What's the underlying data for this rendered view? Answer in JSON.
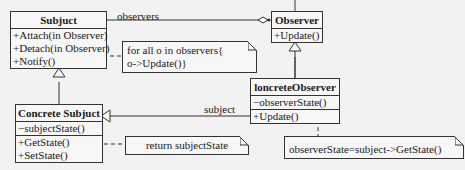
{
  "diagram": {
    "type": "UML class diagram (Observer pattern)",
    "classes": {
      "subject": {
        "name": "Subjuct",
        "attributes": [],
        "operations": [
          "+Attach(in Observer)",
          "+Detach(in Observer)",
          "+Notify()"
        ]
      },
      "observer": {
        "name": "Observer",
        "attributes": [],
        "operations": [
          "+Update()"
        ]
      },
      "concrete_subject": {
        "name": "Concrete Subjuct",
        "attributes": [
          "−subjectState()"
        ],
        "operations": [
          "+GetState()",
          "+SetState()"
        ]
      },
      "concrete_observer": {
        "name": "loncreteObserver",
        "attributes": [
          "−observerState()"
        ],
        "operations": [
          "+Update()"
        ]
      }
    },
    "notes": {
      "notify_note": [
        "for all o in observers{",
        "o->Update()}"
      ],
      "getstate_note": [
        "return subjectState"
      ],
      "update_note": [
        "observerState=subject->GetState()"
      ]
    },
    "associations": {
      "observers_label": "observers",
      "subject_label": "subject"
    }
  }
}
